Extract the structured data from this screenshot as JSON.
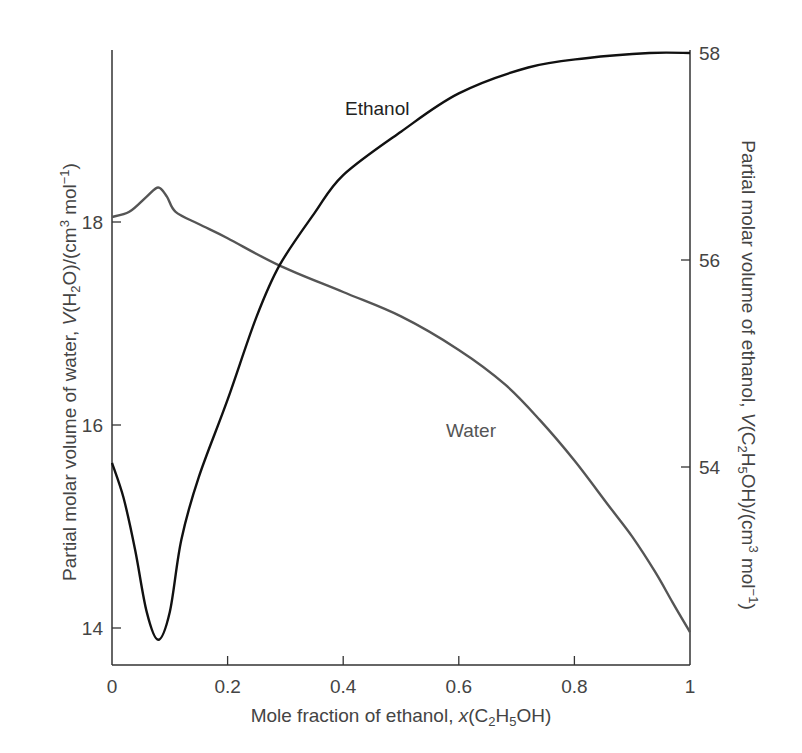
{
  "chart_data": {
    "type": "line",
    "title": "",
    "xlabel": "Mole fraction of ethanol, x(C2H5OH)",
    "xlabel_parts": {
      "pre": "Mole fraction of ethanol, ",
      "italic": "x",
      "post_open": "(C",
      "sub1": "2",
      "mid": "H",
      "sub2": "5",
      "post": "OH)"
    },
    "ylabel_left": "Partial molar volume of water, V(H2O)/(cm3 mol-1)",
    "ylabel_left_parts": {
      "pre": "Partial molar volume of water, ",
      "italic": "V",
      "a": "(H",
      "sub": "2",
      "b": "O)/(cm",
      "sup1": "3",
      "c": " mol",
      "sup2": "−1",
      "d": ")"
    },
    "ylabel_right": "Partial molar volume of ethanol, V(C2H5OH)/(cm3 mol-1)",
    "ylabel_right_parts": {
      "pre": "Partial molar volume of ethanol, ",
      "italic": "V",
      "a": "(C",
      "sub1": "2",
      "b": "H",
      "sub2": "5",
      "c": "OH)/(cm",
      "sup1": "3",
      "d": " mol",
      "sup2": "−1",
      "e": ")"
    },
    "xlim": [
      0,
      1
    ],
    "ylim_left": [
      13.6,
      19.9
    ],
    "ylim_right": [
      52.0,
      58.05
    ],
    "x_ticks": [
      "0",
      "0.2",
      "0.4",
      "0.6",
      "0.8",
      "1"
    ],
    "y_left_ticks": [
      "14",
      "16",
      "18"
    ],
    "y_right_ticks": [
      "54",
      "56",
      "58"
    ],
    "grid": false,
    "legend": "inline labels",
    "series": [
      {
        "name": "Water",
        "axis": "left",
        "color": "#555555",
        "x": [
          0,
          0.03,
          0.06,
          0.08,
          0.095,
          0.11,
          0.15,
          0.2,
          0.29,
          0.4,
          0.5,
          0.6,
          0.68,
          0.74,
          0.8,
          0.86,
          0.9,
          0.94,
          0.97,
          1.0
        ],
        "values": [
          18.05,
          18.1,
          18.25,
          18.34,
          18.25,
          18.1,
          17.98,
          17.84,
          17.57,
          17.31,
          17.07,
          16.74,
          16.4,
          16.05,
          15.65,
          15.2,
          14.9,
          14.55,
          14.25,
          13.96
        ]
      },
      {
        "name": "Ethanol",
        "axis": "right",
        "color": "#111111",
        "x": [
          0,
          0.02,
          0.04,
          0.06,
          0.08,
          0.1,
          0.12,
          0.15,
          0.2,
          0.25,
          0.29,
          0.35,
          0.4,
          0.5,
          0.6,
          0.72,
          0.82,
          0.93,
          1.0
        ],
        "values": [
          54.04,
          53.7,
          53.2,
          52.6,
          52.33,
          52.6,
          53.3,
          53.9,
          54.65,
          55.45,
          55.95,
          56.45,
          56.82,
          57.24,
          57.61,
          57.86,
          57.95,
          58.0,
          58.0
        ]
      }
    ],
    "annotations": [
      {
        "text": "Ethanol",
        "x": 0.4,
        "y_right": 57.3
      },
      {
        "text": "Water",
        "x": 0.58,
        "y_left": 15.95
      }
    ]
  },
  "labels": {
    "ethanol": "Ethanol",
    "water": "Water"
  }
}
